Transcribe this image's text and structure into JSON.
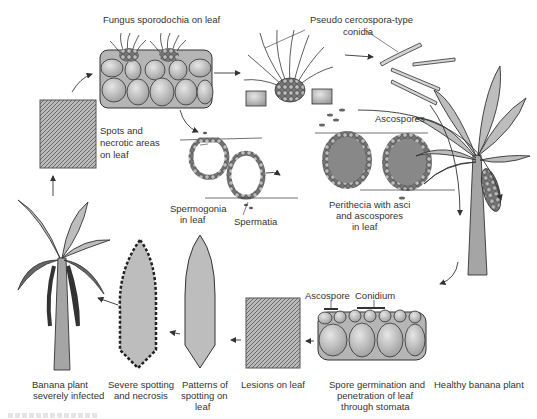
{
  "diagram": {
    "type": "life-cycle",
    "colors": {
      "line": "#333333",
      "cell_fill": "#c9c9c9",
      "cell_shadow": "#9a9a9a",
      "leaf_fill": "#bdbdbd",
      "dark": "#4a4a4a"
    }
  },
  "labels": {
    "sporodochia": "Fungus sporodochia on leaf",
    "conidia_l1": "Pseudo cercospora-type",
    "conidia_l2": "conidia",
    "ascospores": "Ascospores",
    "spots_l1": "Spots and",
    "spots_l2": "necrotic areas",
    "spots_l3": "on leaf",
    "spermogonia_l1": "Spermogonia",
    "spermogonia_l2": "in leaf",
    "spermatia": "Spermatia",
    "perithecia_l1": "Perithecia with asci",
    "perithecia_l2": "and ascospores",
    "perithecia_l3": "in leaf",
    "ascospore": "Ascospore",
    "conidium": "Conidium",
    "infected_l1": "Banana plant",
    "infected_l2": "severely infected",
    "severe_l1": "Severe spotting",
    "severe_l2": "and necrosis",
    "patterns_l1": "Patterns of",
    "patterns_l2": "spotting on",
    "patterns_l3": "leaf",
    "lesions": "Lesions on leaf",
    "germination_l1": "Spore germination and",
    "germination_l2": "penetration of leaf",
    "germination_l3": "through stomata",
    "healthy": "Healthy banana plant"
  },
  "stages": [
    "Healthy banana plant",
    "Spore germination and penetration of leaf through stomata",
    "Lesions on leaf",
    "Patterns of spotting on leaf",
    "Severe spotting and necrosis",
    "Banana plant severely infected",
    "Spots and necrotic areas on leaf",
    "Fungus sporodochia on leaf",
    "Pseudo cercospora-type conidia",
    "Spermogonia in leaf / Spermatia",
    "Perithecia with asci and ascospores in leaf",
    "Ascospores"
  ]
}
